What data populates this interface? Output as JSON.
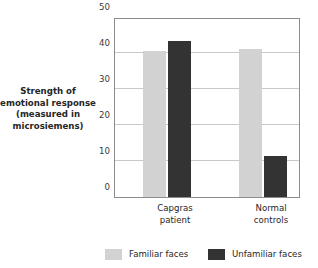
{
  "chart_data": {
    "type": "bar",
    "title": "",
    "xlabel": "",
    "ylabel": "Strength of emotional response (measured in microsiemens)",
    "ylabel_lines": [
      "Strength of",
      "emotional response",
      "(measured in",
      "microsiemens)"
    ],
    "categories": [
      "Capgras patient",
      "Normal controls"
    ],
    "category_lines": [
      [
        "Capgras",
        "patient"
      ],
      [
        "Normal",
        "controls"
      ]
    ],
    "series": [
      {
        "name": "Familiar faces",
        "color": "#d2d2d2",
        "values": [
          40.5,
          41.2
        ]
      },
      {
        "name": "Unfamiliar faces",
        "color": "#333333",
        "values": [
          43.2,
          11.3
        ]
      }
    ],
    "ylim": [
      0,
      50
    ],
    "yticks": [
      0,
      10,
      20,
      30,
      40,
      50
    ],
    "ytick_labels": [
      "0",
      "10",
      "20",
      "30",
      "40",
      "50"
    ],
    "grid": true,
    "legend_position": "bottom"
  },
  "colors": {
    "familiar": "#d2d2d2",
    "unfamiliar": "#333333",
    "gridline": "#c8c8c8",
    "frame": "#8c8c8c",
    "text": "#262626"
  }
}
